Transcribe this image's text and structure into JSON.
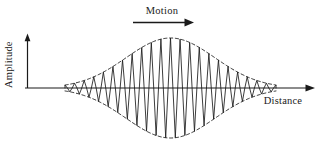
{
  "figure": {
    "title": "",
    "axis_labels": {
      "y": "Amplitude",
      "x": "Distance"
    },
    "annotations": {
      "motion": "Motion"
    },
    "colors": {
      "ink": "#1a1a1a",
      "background": "#ffffff"
    },
    "icons": {
      "x_axis_arrow": "arrow-right-icon",
      "y_axis_arrow": "arrow-up-icon",
      "motion_arrow": "arrow-right-icon"
    }
  },
  "chart_data": {
    "type": "line",
    "title": "",
    "xlabel": "Distance",
    "ylabel": "Amplitude",
    "grid": false,
    "legend": null,
    "xlim": [
      0,
      1
    ],
    "ylim": [
      -1,
      1
    ],
    "annotations": [
      {
        "text": "Motion",
        "type": "arrow-label",
        "direction": "right",
        "x": 0.52,
        "y": 1.15
      }
    ],
    "series": [
      {
        "name": "wave-packet",
        "style": "solid",
        "carrier_cycles": 22,
        "envelope": "gaussian",
        "envelope_center": 0.5,
        "envelope_sigma": 0.145,
        "amplitude": 1.0,
        "x_start": 0.155,
        "x_end": 0.845
      },
      {
        "name": "envelope-upper",
        "style": "dashed",
        "envelope": "gaussian",
        "sign": 1
      },
      {
        "name": "envelope-lower",
        "style": "dashed",
        "envelope": "gaussian",
        "sign": -1
      }
    ]
  }
}
